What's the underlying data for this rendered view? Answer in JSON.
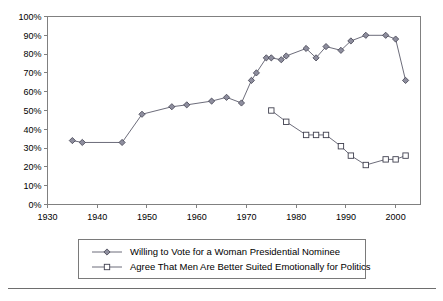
{
  "chart_data": {
    "type": "line",
    "title": "",
    "subtitle": "",
    "xlabel": "",
    "ylabel": "",
    "xlim": [
      1930,
      2005
    ],
    "ylim": [
      0,
      100
    ],
    "grid": false,
    "legend_position": "bottom",
    "x_ticks": [
      1930,
      1940,
      1950,
      1960,
      1970,
      1980,
      1990,
      2000
    ],
    "x_tick_labels": [
      "1930",
      "1940",
      "1950",
      "1960",
      "1970",
      "1980",
      "1990",
      "2000"
    ],
    "y_ticks": [
      0,
      10,
      20,
      30,
      40,
      50,
      60,
      70,
      80,
      90,
      100
    ],
    "y_tick_labels": [
      "0%",
      "10%",
      "20%",
      "30%",
      "40%",
      "50%",
      "60%",
      "70%",
      "80%",
      "90%",
      "100%"
    ],
    "series": [
      {
        "name": "Willing to Vote for a Woman Presidential Nominee",
        "marker": "diamond",
        "x": [
          1935,
          1937,
          1945,
          1949,
          1955,
          1958,
          1963,
          1966,
          1969,
          1971,
          1972,
          1974,
          1975,
          1977,
          1978,
          1982,
          1984,
          1986,
          1989,
          1991,
          1994,
          1998,
          2000,
          2002
        ],
        "values": [
          34,
          33,
          33,
          48,
          52,
          53,
          55,
          57,
          54,
          66,
          70,
          78,
          78,
          77,
          79,
          83,
          78,
          84,
          82,
          87,
          90,
          90,
          88,
          66
        ]
      },
      {
        "name": "Agree That Men Are Better Suited Emotionally for Politics",
        "marker": "square",
        "x": [
          1975,
          1978,
          1982,
          1984,
          1986,
          1989,
          1991,
          1994,
          1998,
          2000,
          2002
        ],
        "values": [
          50,
          44,
          37,
          37,
          37,
          31,
          26,
          21,
          24,
          24,
          26
        ]
      }
    ]
  },
  "legend": {
    "entries": [
      {
        "label": "Willing to Vote for a Woman Presidential Nominee",
        "marker": "diamond"
      },
      {
        "label": "Agree That Men Are Better Suited Emotionally for Politics",
        "marker": "square"
      }
    ]
  },
  "colors": {
    "series_line": "#5b5b6b",
    "diamond_fill": "#8e8e9e",
    "square_fill": "#ffffff",
    "marker_stroke": "#40404f",
    "frame": "#808080",
    "text": "#000000",
    "background": "#ffffff"
  }
}
